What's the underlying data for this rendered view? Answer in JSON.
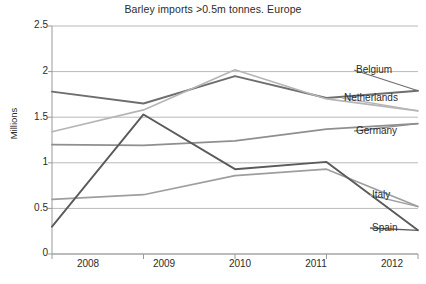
{
  "chart_data": {
    "type": "line",
    "title": "Barley imports >0.5m tonnes. Europe",
    "xlabel": "",
    "ylabel": "Millions",
    "x": [
      2008,
      2009,
      2010,
      2011,
      2012
    ],
    "categories": [
      "2008",
      "2009",
      "2010",
      "2011",
      "2012"
    ],
    "ylim": [
      0,
      2.5
    ],
    "yticks": [
      0,
      0.5,
      1,
      1.5,
      2,
      2.5
    ],
    "ytick_labels": [
      "0",
      "0.5",
      "1",
      "1.5",
      "2",
      "2.5"
    ],
    "grid": true,
    "legend_position": "right-inline-labels",
    "series": [
      {
        "name": "Belgium",
        "values": [
          1.78,
          1.65,
          1.95,
          1.71,
          1.79
        ],
        "color": "#6e6e6e"
      },
      {
        "name": "Netherlands",
        "values": [
          1.34,
          1.58,
          2.02,
          1.7,
          1.57
        ],
        "color": "#b5b5b5"
      },
      {
        "name": "Germany",
        "values": [
          1.2,
          1.19,
          1.24,
          1.37,
          1.43
        ],
        "color": "#8f8f8f"
      },
      {
        "name": "Italy",
        "values": [
          0.6,
          0.65,
          0.86,
          0.93,
          0.52
        ],
        "color": "#9e9e9e"
      },
      {
        "name": "Spain",
        "values": [
          0.3,
          1.53,
          0.93,
          1.01,
          0.26
        ],
        "color": "#5a5a5a"
      }
    ]
  },
  "axis": {
    "y_title": "Millions"
  },
  "labels": {
    "belgium": "Belgium",
    "netherlands": "Netherlands",
    "germany": "Germany",
    "italy": "Italy",
    "spain": "Spain"
  }
}
